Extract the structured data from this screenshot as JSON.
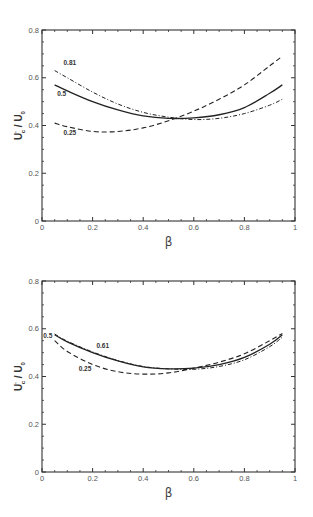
{
  "chart_data": [
    {
      "type": "line",
      "title": "",
      "xlabel": "β",
      "ylabel": "U'c / U0",
      "xlim": [
        0,
        1
      ],
      "ylim": [
        0,
        0.8
      ],
      "xticks": [
        "0",
        "0.2",
        "0.4",
        "0.6",
        "0.8",
        "1"
      ],
      "yticks": [
        "0",
        "0.2",
        "0.4",
        "0.6",
        "0.8"
      ],
      "grid": false,
      "legend": "inline labels",
      "x": [
        0.05,
        0.1,
        0.2,
        0.3,
        0.4,
        0.5,
        0.6,
        0.7,
        0.8,
        0.9,
        0.95
      ],
      "series": [
        {
          "name": "0.81",
          "style": "dash-dot",
          "values": [
            0.63,
            0.6,
            0.54,
            0.49,
            0.455,
            0.435,
            0.425,
            0.43,
            0.45,
            0.485,
            0.51
          ]
        },
        {
          "name": "0.5",
          "style": "solid",
          "values": [
            0.57,
            0.545,
            0.5,
            0.465,
            0.44,
            0.43,
            0.432,
            0.445,
            0.475,
            0.535,
            0.57
          ]
        },
        {
          "name": "0.25",
          "style": "dashed",
          "values": [
            0.41,
            0.395,
            0.375,
            0.375,
            0.39,
            0.42,
            0.46,
            0.51,
            0.57,
            0.65,
            0.69
          ]
        }
      ],
      "labels": [
        {
          "text": "0.81",
          "x": 0.085,
          "y": 0.655
        },
        {
          "text": "0.5",
          "x": 0.06,
          "y": 0.525
        },
        {
          "text": "0.25",
          "x": 0.085,
          "y": 0.36
        }
      ]
    },
    {
      "type": "line",
      "title": "",
      "xlabel": "β",
      "ylabel": "U'c / U0",
      "xlim": [
        0,
        1
      ],
      "ylim": [
        0,
        0.8
      ],
      "xticks": [
        "0",
        "0.2",
        "0.4",
        "0.6",
        "0.8",
        "1"
      ],
      "yticks": [
        "0",
        "0.2",
        "0.4",
        "0.6",
        "0.8"
      ],
      "grid": false,
      "legend": "inline labels",
      "x": [
        0.05,
        0.1,
        0.2,
        0.3,
        0.4,
        0.5,
        0.6,
        0.7,
        0.8,
        0.9,
        0.95
      ],
      "series": [
        {
          "name": "0.5",
          "style": "solid",
          "values": [
            0.575,
            0.545,
            0.5,
            0.465,
            0.44,
            0.432,
            0.435,
            0.45,
            0.48,
            0.535,
            0.575
          ]
        },
        {
          "name": "0.61",
          "style": "dash-dot",
          "values": [
            0.578,
            0.548,
            0.503,
            0.467,
            0.442,
            0.432,
            0.43,
            0.442,
            0.47,
            0.525,
            0.565
          ]
        },
        {
          "name": "0.25",
          "style": "dashed",
          "values": [
            0.55,
            0.505,
            0.45,
            0.42,
            0.41,
            0.415,
            0.435,
            0.46,
            0.495,
            0.55,
            0.58
          ]
        }
      ],
      "labels": [
        {
          "text": "0.5",
          "x": 0.005,
          "y": 0.56
        },
        {
          "text": "0.61",
          "x": 0.215,
          "y": 0.52
        },
        {
          "text": "0.25",
          "x": 0.145,
          "y": 0.425
        }
      ]
    }
  ]
}
